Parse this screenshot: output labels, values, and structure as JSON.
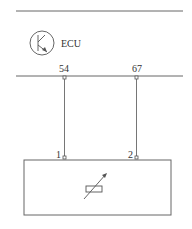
{
  "diagram": {
    "ecu_label": "ECU",
    "ecu_icon": "transistor-icon",
    "sensor_icon": "variable-resistor-icon",
    "line_color": "#555555",
    "ecu_pins": [
      {
        "label": "54"
      },
      {
        "label": "67"
      }
    ],
    "sensor_pins": [
      {
        "label": "1"
      },
      {
        "label": "2"
      }
    ]
  }
}
